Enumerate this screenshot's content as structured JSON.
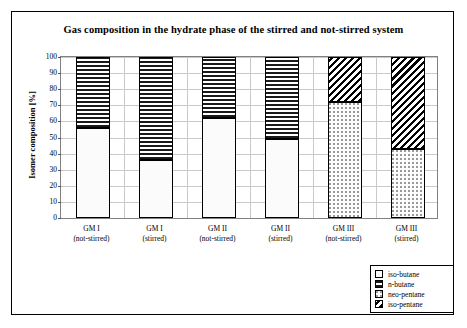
{
  "chart_data": {
    "type": "bar",
    "stacked": true,
    "title": "Gas composition in the hydrate phase of the stirred and not-stirred system",
    "xlabel": "",
    "ylabel": "Isomer composition [%]",
    "ylim": [
      0,
      100
    ],
    "ytick_step": 10,
    "yticks": [
      "100",
      "90",
      "80",
      "70",
      "60",
      "50",
      "40",
      "30",
      "20",
      "10",
      "0"
    ],
    "grid": true,
    "legend_position": "bottom-right",
    "categories": [
      "GM I\n(not-stirred)",
      "GM I\n(stirred)",
      "GM II\n(not-stirred)",
      "GM II\n(stirred)",
      "GM III\n(not-stirred)",
      "GM III\n(stirred)"
    ],
    "category_labels": [
      {
        "line1": "GM I",
        "line2": "(not-stirred)"
      },
      {
        "line1": "GM I",
        "line2": "(stirred)"
      },
      {
        "line1": "GM II",
        "line2": "(not-stirred)"
      },
      {
        "line1": "GM II",
        "line2": "(stirred)"
      },
      {
        "line1": "GM III",
        "line2": "(not-stirred)"
      },
      {
        "line1": "GM III",
        "line2": "(stirred)"
      }
    ],
    "series": [
      {
        "name": "iso-butane",
        "pattern": "light-dots",
        "values": [
          56,
          36,
          62,
          49,
          0,
          0
        ]
      },
      {
        "name": "n-butane",
        "pattern": "horizontal-lines",
        "values": [
          44,
          64,
          38,
          51,
          0,
          0
        ]
      },
      {
        "name": "neo-pentane",
        "pattern": "dots",
        "values": [
          0,
          0,
          0,
          0,
          72,
          43
        ]
      },
      {
        "name": "iso-pentane",
        "pattern": "diagonal-hatch",
        "values": [
          0,
          0,
          0,
          0,
          28,
          57
        ]
      }
    ],
    "bars": [
      {
        "category": "GM I (not-stirred)",
        "segments": [
          {
            "series": "iso-butane",
            "from": 0,
            "to": 56
          },
          {
            "series": "n-butane",
            "from": 56,
            "to": 100
          }
        ]
      },
      {
        "category": "GM I (stirred)",
        "segments": [
          {
            "series": "iso-butane",
            "from": 0,
            "to": 36
          },
          {
            "series": "n-butane",
            "from": 36,
            "to": 100
          }
        ]
      },
      {
        "category": "GM II (not-stirred)",
        "segments": [
          {
            "series": "iso-butane",
            "from": 0,
            "to": 62
          },
          {
            "series": "n-butane",
            "from": 62,
            "to": 100
          }
        ]
      },
      {
        "category": "GM II (stirred)",
        "segments": [
          {
            "series": "iso-butane",
            "from": 0,
            "to": 49
          },
          {
            "series": "n-butane",
            "from": 49,
            "to": 100
          }
        ]
      },
      {
        "category": "GM III (not-stirred)",
        "segments": [
          {
            "series": "neo-pentane",
            "from": 0,
            "to": 72
          },
          {
            "series": "iso-pentane",
            "from": 72,
            "to": 100
          }
        ]
      },
      {
        "category": "GM III (stirred)",
        "segments": [
          {
            "series": "neo-pentane",
            "from": 0,
            "to": 43
          },
          {
            "series": "iso-pentane",
            "from": 43,
            "to": 100
          }
        ]
      }
    ],
    "legend": [
      {
        "label": "iso-butane"
      },
      {
        "label": "n-butane"
      },
      {
        "label": "neo-pentane"
      },
      {
        "label": "iso-pentane"
      }
    ]
  },
  "colors": {
    "frame": "#000000",
    "gridline": "#c9c9c9",
    "plot_border": "#808080",
    "hatch": "#000000",
    "background": "#ffffff"
  }
}
